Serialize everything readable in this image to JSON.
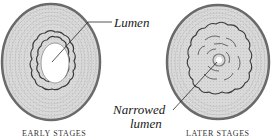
{
  "figure": {
    "panels": [
      {
        "id": "early",
        "caption": "EARLY STAGES",
        "label": "Lumen"
      },
      {
        "id": "later",
        "caption": "LATER STAGES",
        "label_line1": "Narrowed",
        "label_line2": "lumen"
      }
    ]
  },
  "colors": {
    "outer_wall": "#6e6e6e",
    "wall_fill": "#d6d6d6",
    "ring_lines": "#b0b0b0",
    "plaque_outline": "#3a3a3a",
    "lumen": "#ffffff",
    "text": "#1a1a1a"
  }
}
